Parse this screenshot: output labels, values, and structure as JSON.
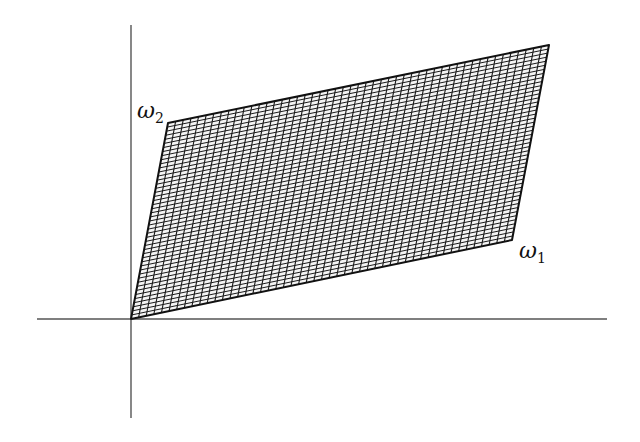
{
  "diagram": {
    "type": "lattice-parallelogram",
    "origin": [
      131,
      319
    ],
    "axes": {
      "x": {
        "from": 37,
        "to": 607,
        "y": 319
      },
      "y": {
        "from": 25,
        "to": 418,
        "x": 131
      },
      "color": "#555555"
    },
    "vectors": {
      "omega1": {
        "end": [
          512,
          240
        ],
        "label_base": "ω",
        "label_sub": "1"
      },
      "omega2": {
        "end": [
          168,
          123
        ],
        "label_base": "ω",
        "label_sub": "2"
      }
    },
    "far_corner": [
      549,
      45
    ],
    "grid": {
      "divisions_omega1": 50,
      "divisions_omega2": 48,
      "line_color": "#1a1a1a",
      "fill": "#f4f4f4"
    },
    "outline_color": "#111111"
  }
}
